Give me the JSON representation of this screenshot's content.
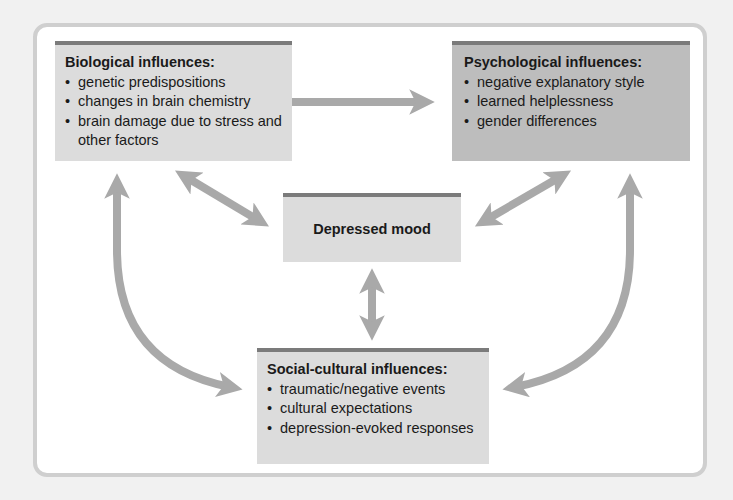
{
  "diagram": {
    "biological": {
      "title": "Biological influences:",
      "items": [
        "genetic predispositions",
        "changes in brain chemistry",
        "brain damage due to stress and other factors"
      ]
    },
    "psychological": {
      "title": "Psychological influences:",
      "items": [
        "negative explanatory style",
        "learned helplessness",
        "gender differences"
      ]
    },
    "center": {
      "title": "Depressed mood"
    },
    "social_cultural": {
      "title": "Social-cultural influences:",
      "items": [
        "traumatic/negative events",
        "cultural expectations",
        "depression-evoked responses"
      ]
    },
    "connections": [
      {
        "from": "biological",
        "to": "psychological",
        "type": "bidirectional"
      },
      {
        "from": "biological",
        "to": "center",
        "type": "bidirectional"
      },
      {
        "from": "psychological",
        "to": "center",
        "type": "bidirectional"
      },
      {
        "from": "center",
        "to": "social_cultural",
        "type": "bidirectional"
      },
      {
        "from": "biological",
        "to": "social_cultural",
        "type": "bidirectional-curved"
      },
      {
        "from": "psychological",
        "to": "social_cultural",
        "type": "bidirectional-curved"
      }
    ],
    "colors": {
      "arrow": "#a9a9a9",
      "box_light": "#dcdcdc",
      "box_dark": "#bdbdbd",
      "box_header_rule": "#7b7b7b",
      "frame_border": "#cfcfcf"
    }
  }
}
